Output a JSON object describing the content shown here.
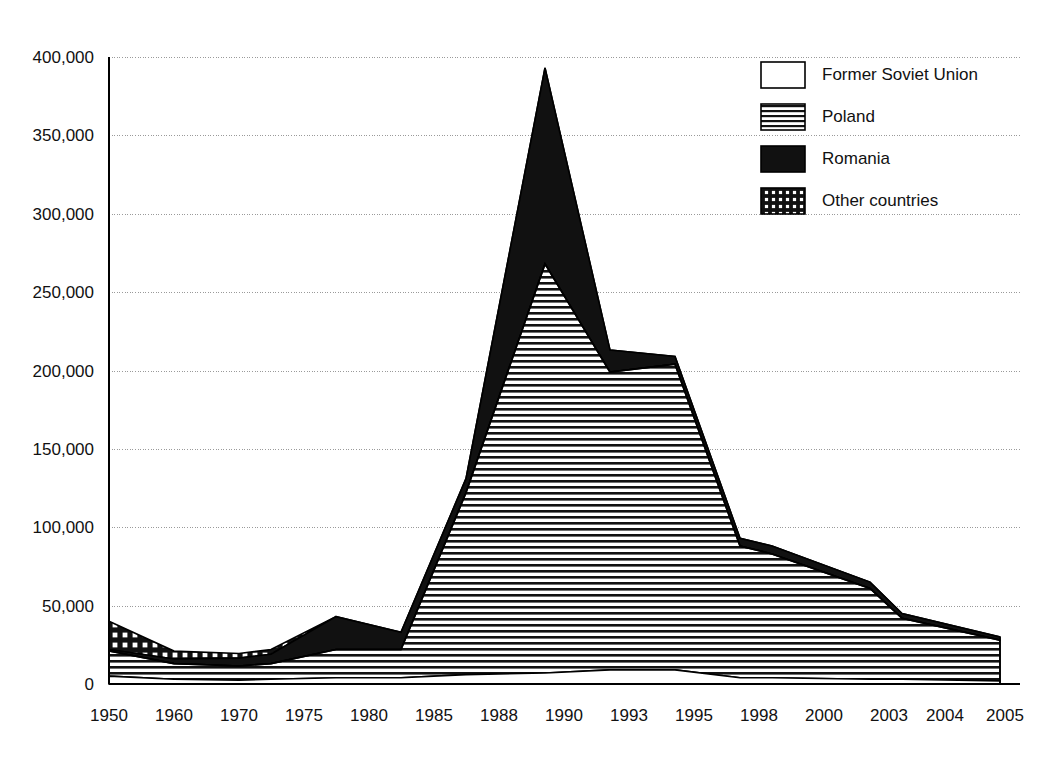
{
  "chart_data": {
    "type": "area",
    "stacked": true,
    "title": "",
    "subtitle": "",
    "xlabel": "",
    "ylabel": "",
    "grid": true,
    "legend_position": "top-right",
    "categories": [
      "1950",
      "1960",
      "1970",
      "1975",
      "1980",
      "1985",
      "1988",
      "1990",
      "1993",
      "1995",
      "1998",
      "2000",
      "2003",
      "2004",
      "2005"
    ],
    "ylim": [
      0,
      400000
    ],
    "yticks": [
      0,
      50000,
      100000,
      150000,
      200000,
      250000,
      300000,
      350000,
      400000
    ],
    "ytick_labels": [
      "0",
      "50,000",
      "100,000",
      "150,000",
      "200,000",
      "250,000",
      "300,000",
      "350,000",
      "400,000"
    ],
    "series": [
      {
        "name": "Former Soviet Union",
        "fill": "white",
        "pattern": "none",
        "values": [
          5000,
          3000,
          2500,
          3000,
          4000,
          4000,
          6000,
          7000,
          9000,
          9000,
          4000,
          4000,
          3000,
          3000,
          2000
        ]
      },
      {
        "name": "Poland",
        "fill": "horizontal-lines",
        "pattern": "horizontal",
        "values": [
          16000,
          10000,
          9000,
          10000,
          18000,
          18000,
          116000,
          261000,
          190000,
          195000,
          84000,
          79000,
          58000,
          39000,
          26000
        ]
      },
      {
        "name": "Romania",
        "fill": "solid-black",
        "pattern": "solid",
        "values": [
          1000,
          3000,
          5000,
          6000,
          21000,
          11000,
          9000,
          125000,
          14000,
          5000,
          5000,
          5000,
          4000,
          3000,
          2000
        ]
      },
      {
        "name": "Other countries",
        "fill": "crosshatch",
        "pattern": "grid",
        "values": [
          18000,
          5000,
          3000,
          3000,
          0,
          0,
          0,
          0,
          0,
          0,
          0,
          0,
          0,
          0,
          0
        ]
      }
    ],
    "totals": [
      40000,
      21000,
      19500,
      22000,
      43000,
      33000,
      131000,
      393000,
      213000,
      209000,
      93000,
      88000,
      65000,
      45000,
      30000
    ]
  },
  "legend": {
    "items": [
      {
        "label": "Former Soviet Union",
        "swatch": "white-box"
      },
      {
        "label": "Poland",
        "swatch": "horizontal-lines-box"
      },
      {
        "label": "Romania",
        "swatch": "solid-black-box"
      },
      {
        "label": "Other countries",
        "swatch": "crosshatch-box"
      }
    ]
  },
  "axes": {
    "y_labels": [
      "400,000",
      "350,000",
      "300,000",
      "250,000",
      "200,000",
      "150,000",
      "100,000",
      "50,000",
      "0"
    ],
    "x_labels": [
      "1950",
      "1960",
      "1970",
      "1975",
      "1980",
      "1985",
      "1988",
      "1990",
      "1993",
      "1995",
      "1998",
      "2000",
      "2003",
      "2004",
      "2005"
    ]
  }
}
